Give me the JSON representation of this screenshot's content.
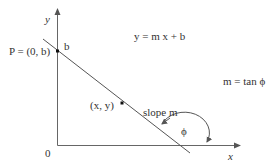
{
  "diagram": {
    "axis_labels": {
      "y": "y",
      "x": "x",
      "origin": "0"
    },
    "point_p_label": "P = (0, b)",
    "intercept_label": "b",
    "equation": "y = m x + b",
    "slope_relation": "m = tan ϕ",
    "point_xy_label": "(x, y)",
    "slope_label": "slope m",
    "angle_label": "ϕ",
    "colors": {
      "stroke": "#555555",
      "text": "#333333",
      "point": "#111111"
    }
  }
}
